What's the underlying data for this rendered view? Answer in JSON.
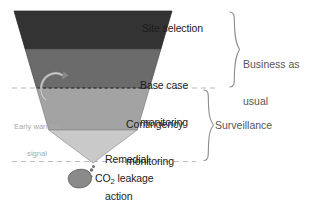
{
  "figure": {
    "background_color": "#ffffff"
  },
  "funnel": {
    "shape": "inverted-triangle",
    "apex": {
      "x": 93,
      "y": 163
    },
    "top_left": {
      "x": 14,
      "y": 11
    },
    "top_right": {
      "x": 172,
      "y": 11
    },
    "bands": [
      {
        "id": "site-selection",
        "label": "Site selection",
        "color": "#333333",
        "y_top": 11,
        "y_bottom": 49
      },
      {
        "id": "base-case-monitoring",
        "label": "Base case\nmonitoring",
        "label_line1": "Base case",
        "label_line2": "monitoring",
        "color": "#6b6b6b",
        "y_top": 49,
        "y_bottom": 88
      },
      {
        "id": "contingency-monitoring",
        "label": "Contingency\nmonitoring",
        "label_line1": "Contingency",
        "label_line2": "monitoring",
        "color": "#a3a3a3",
        "y_top": 88,
        "y_bottom": 130
      },
      {
        "id": "remedial-action",
        "label": "Remedial\naction",
        "label_line1": "Remedial",
        "label_line2": "action",
        "color": "#c9c9c9",
        "y_top": 130,
        "y_bottom": 163
      }
    ]
  },
  "brackets": [
    {
      "id": "business-as-usual",
      "label_line1": "Business as",
      "label_line2": "usual",
      "y_top": 11,
      "y_bottom": 88,
      "color": "#8c8c8c"
    },
    {
      "id": "surveillance",
      "label_line1": "Surveillance",
      "label_line2": "",
      "y_top": 88,
      "y_bottom": 162,
      "color": "#8c8c8c"
    }
  ],
  "annotations": {
    "early_warning": {
      "label_line1": "Early warning",
      "label_line2": "signal",
      "color": "#a9a9a9",
      "arrow": "curved-up-arrow"
    },
    "leakage": {
      "label_prefix": "CO",
      "label_subscript": "2",
      "label_suffix": " leakage",
      "blob_color": "#8a8a8a"
    }
  },
  "guides": {
    "dashed_line_upper_y": 88,
    "dashed_line_lower_y": 161,
    "dashed_color": "#b9b9b9"
  },
  "icons": {
    "co2-blob-icon": "co2-blob-icon",
    "early-warning-arrow-icon": "early-warning-arrow-icon",
    "bubble-trail-icon": "bubble-trail-icon"
  }
}
